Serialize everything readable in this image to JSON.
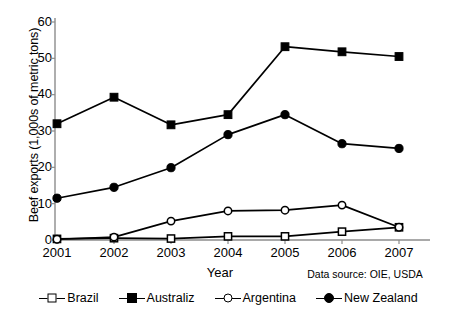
{
  "chart_data": {
    "type": "line",
    "title": "",
    "xlabel": "Year",
    "ylabel": "Beef exports (1,000s of metric tons)",
    "categories": [
      "2001",
      "2002",
      "2003",
      "2004",
      "2005",
      "2006",
      "2007"
    ],
    "xlim": [
      2001,
      2007
    ],
    "ylim": [
      0,
      60
    ],
    "yticks": [
      0,
      10,
      20,
      30,
      40,
      50,
      60
    ],
    "grid": false,
    "legend_position": "bottom",
    "annotations": [
      "Data source: OIE, USDA"
    ],
    "series": [
      {
        "name": "Brazil",
        "marker": "square-open",
        "values": [
          0.3,
          0.5,
          0.4,
          1.0,
          1.0,
          2.3,
          3.5
        ]
      },
      {
        "name": "Australiz",
        "marker": "square-filled",
        "values": [
          32.0,
          39.3,
          31.7,
          34.5,
          53.2,
          51.8,
          50.5
        ]
      },
      {
        "name": "Argentina",
        "marker": "circle-open",
        "values": [
          0.2,
          0.8,
          5.2,
          8.0,
          8.2,
          9.6,
          3.5
        ]
      },
      {
        "name": "New Zealand",
        "marker": "circle-filled",
        "values": [
          11.5,
          14.5,
          19.9,
          29.0,
          34.5,
          26.5,
          25.2
        ]
      }
    ]
  },
  "axis": {
    "ylabel": "Beef exports (1,000s of metric tons)",
    "xlabel": "Year",
    "ytick_labels": [
      "60",
      "50",
      "40",
      "30",
      "20",
      "10",
      "0"
    ],
    "xtick_labels": [
      "2001",
      "2002",
      "2003",
      "2004",
      "2005",
      "2006",
      "2007"
    ]
  },
  "note": {
    "source_text": "Data source: OIE, USDA"
  },
  "legend": {
    "items": [
      {
        "label": "Brazil"
      },
      {
        "label": "Australiz"
      },
      {
        "label": "Argentina"
      },
      {
        "label": "New Zealand"
      }
    ]
  },
  "colors": {
    "ink": "#000000",
    "background": "#ffffff",
    "axis": "#8c8c8c"
  }
}
